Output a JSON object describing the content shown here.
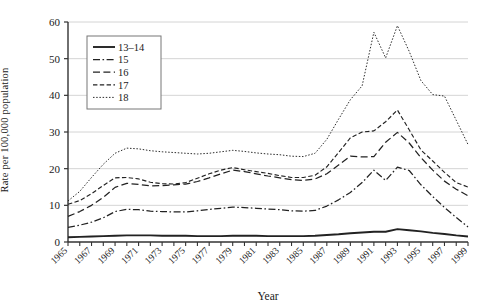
{
  "chart_data": {
    "type": "line",
    "title": "",
    "xlabel": "Year",
    "ylabel": "Rate per 100,000 population",
    "xlim": [
      1965,
      1999
    ],
    "ylim": [
      0,
      60
    ],
    "yticks": [
      0,
      10,
      20,
      30,
      40,
      50,
      60
    ],
    "xticks": [
      1965,
      1967,
      1969,
      1971,
      1973,
      1975,
      1977,
      1979,
      1981,
      1983,
      1985,
      1987,
      1989,
      1991,
      1993,
      1995,
      1997,
      1999
    ],
    "grid": "horizontal",
    "legend_position": "upper-left-inset",
    "x": [
      1965,
      1966,
      1967,
      1968,
      1969,
      1970,
      1971,
      1972,
      1973,
      1974,
      1975,
      1976,
      1977,
      1978,
      1979,
      1980,
      1981,
      1982,
      1983,
      1984,
      1985,
      1986,
      1987,
      1988,
      1989,
      1990,
      1991,
      1992,
      1993,
      1994,
      1995,
      1996,
      1997,
      1998,
      1999
    ],
    "series": [
      {
        "name": "13–14",
        "dash": "solid",
        "values": [
          1.3,
          1.4,
          1.5,
          1.6,
          1.7,
          1.8,
          1.8,
          1.8,
          1.7,
          1.7,
          1.7,
          1.6,
          1.6,
          1.6,
          1.7,
          1.7,
          1.7,
          1.6,
          1.6,
          1.6,
          1.6,
          1.7,
          1.9,
          2.1,
          2.4,
          2.6,
          2.8,
          2.8,
          3.5,
          3.2,
          2.9,
          2.5,
          2.2,
          1.8,
          1.5
        ]
      },
      {
        "name": "15",
        "dash": "dashdot",
        "values": [
          4.0,
          4.6,
          5.4,
          6.6,
          8.3,
          8.9,
          8.8,
          8.4,
          8.3,
          8.2,
          8.2,
          8.5,
          8.9,
          9.2,
          9.5,
          9.4,
          9.2,
          9.0,
          8.8,
          8.5,
          8.4,
          8.6,
          9.8,
          11.5,
          13.5,
          16.2,
          19.6,
          16.8,
          20.4,
          19.5,
          15.6,
          12.4,
          9.4,
          6.7,
          4.1
        ]
      },
      {
        "name": "16",
        "dash": "dash",
        "values": [
          7.0,
          8.3,
          10.0,
          12.2,
          14.9,
          16.0,
          15.7,
          15.3,
          15.4,
          15.6,
          15.8,
          16.5,
          17.5,
          18.6,
          19.6,
          19.2,
          18.6,
          18.0,
          17.5,
          17.0,
          16.8,
          17.2,
          18.6,
          21.0,
          23.4,
          23.2,
          23.3,
          27.2,
          29.9,
          27.0,
          23.0,
          19.6,
          16.6,
          14.4,
          12.6
        ]
      },
      {
        "name": "17",
        "dash": "shortdash",
        "values": [
          10.3,
          11.3,
          13.2,
          15.4,
          17.5,
          17.6,
          17.2,
          16.3,
          15.9,
          15.8,
          16.2,
          17.4,
          18.6,
          19.6,
          20.3,
          19.7,
          19.2,
          18.7,
          18.1,
          17.6,
          17.6,
          18.2,
          20.5,
          24.4,
          28.4,
          30.0,
          30.3,
          32.8,
          36.0,
          30.6,
          25.1,
          22.1,
          19.0,
          16.2,
          15.0
        ]
      },
      {
        "name": "18",
        "dash": "dotted",
        "values": [
          11.2,
          13.8,
          17.6,
          21.2,
          24.2,
          25.6,
          25.4,
          24.9,
          24.6,
          24.4,
          24.2,
          24.0,
          24.2,
          24.6,
          25.0,
          24.7,
          24.3,
          24.0,
          23.8,
          23.4,
          23.3,
          24.2,
          28.0,
          33.5,
          38.8,
          42.6,
          57.2,
          50.2,
          59.0,
          52.0,
          44.0,
          40.2,
          39.8,
          33.2,
          26.6
        ]
      }
    ]
  },
  "legend": {
    "items": [
      {
        "label": "13–14"
      },
      {
        "label": "15"
      },
      {
        "label": "16"
      },
      {
        "label": "17"
      },
      {
        "label": "18"
      }
    ]
  },
  "axis": {
    "ylabel": "Rate per 100,000 population",
    "xlabel": "Year",
    "ytick_labels": [
      "0",
      "10",
      "20",
      "30",
      "40",
      "50",
      "60"
    ],
    "xtick_labels": [
      "1965",
      "1967",
      "1969",
      "1971",
      "1973",
      "1975",
      "1977",
      "1979",
      "1981",
      "1983",
      "1985",
      "1987",
      "1989",
      "1991",
      "1993",
      "1995",
      "1997",
      "1999"
    ]
  }
}
